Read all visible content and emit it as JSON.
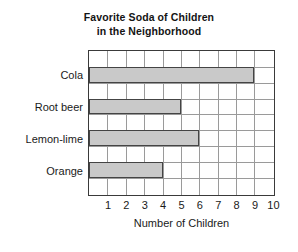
{
  "chart_data": {
    "type": "bar",
    "orientation": "horizontal",
    "title": "Favorite Soda of Children in the Neighborhood",
    "title_lines": [
      "Favorite Soda of Children",
      "in the Neighborhood"
    ],
    "categories": [
      "Cola",
      "Root beer",
      "Lemon-lime",
      "Orange"
    ],
    "values": [
      9,
      5,
      6,
      4
    ],
    "xlabel": "Number of Children",
    "ylabel": "",
    "xlim": [
      0,
      10
    ],
    "xticks": [
      1,
      2,
      3,
      4,
      5,
      6,
      7,
      8,
      9,
      10
    ],
    "xtick_labels": [
      "1",
      "2",
      "3",
      "4",
      "5",
      "6",
      "7",
      "8",
      "9",
      "10"
    ],
    "grid": "vertical-and-horizontal",
    "legend": "none",
    "bar_fill_color": "#c9c9c9",
    "bar_edge_color": "#444444",
    "grid_color": "#9a9a9a",
    "axis_color": "#3a3a3a",
    "background_color": "#ffffff"
  }
}
